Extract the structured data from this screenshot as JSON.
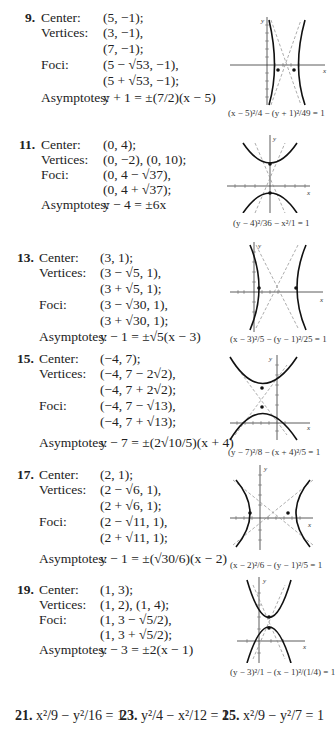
{
  "problems": [
    {
      "number": "9.",
      "labels": {
        "center": "Center:",
        "vertices": "Vertices:",
        "foci": "Foci:",
        "asymptotes": "Asymptotes:"
      },
      "center": "(5, −1);",
      "vertices": [
        "(3, −1),",
        "(7, −1);"
      ],
      "foci": [
        "(5 − √53, −1),",
        "(5 + √53, −1);"
      ],
      "asymptotes": "y + 1 = ±(7/2)(x − 5)",
      "graph_equation": "(x − 5)²/4 − (y + 1)²/49 = 1"
    },
    {
      "number": "11.",
      "labels": {
        "center": "Center:",
        "vertices": "Vertices:",
        "foci": "Foci:",
        "asymptotes": "Asymptotes:"
      },
      "center": "(0, 4);",
      "vertices": [
        "(0, −2), (0, 10);"
      ],
      "foci": [
        "(0, 4 − √37),",
        "(0, 4 + √37);"
      ],
      "asymptotes": "y − 4 = ±6x",
      "graph_equation": "(y − 4)²/36 − x²/1 = 1"
    },
    {
      "number": "13.",
      "labels": {
        "center": "Center:",
        "vertices": "Vertices:",
        "foci": "Foci:",
        "asymptotes": "Asymptotes:"
      },
      "center": "(3, 1);",
      "vertices": [
        "(3 − √5, 1),",
        "(3 + √5, 1);"
      ],
      "foci": [
        "(3 − √30, 1),",
        "(3 + √30, 1);"
      ],
      "asymptotes": "y − 1 = ±√5(x − 3)",
      "graph_equation": "(x − 3)²/5 − (y − 1)²/25 = 1"
    },
    {
      "number": "15.",
      "labels": {
        "center": "Center:",
        "vertices": "Vertices:",
        "foci": "Foci:",
        "asymptotes": "Asymptotes:"
      },
      "center": "(−4, 7);",
      "vertices": [
        "(−4, 7 − 2√2),",
        "(−4, 7 + 2√2);"
      ],
      "foci": [
        "(−4, 7 − √13),",
        "(−4, 7 + √13);"
      ],
      "asymptotes": "y − 7 = ±(2√10/5)(x + 4)",
      "graph_equation": "(y − 7)²/8 − (x + 4)²/5 = 1"
    },
    {
      "number": "17.",
      "labels": {
        "center": "Center:",
        "vertices": "Vertices:",
        "foci": "Foci:",
        "asymptotes": "Asymptotes:"
      },
      "center": "(2, 1);",
      "vertices": [
        "(2 − √6, 1),",
        "(2 + √6, 1);"
      ],
      "foci": [
        "(2 − √11, 1),",
        "(2 + √11, 1);"
      ],
      "asymptotes": "y − 1 = ±(√30/6)(x − 2)",
      "graph_equation": "(x − 2)²/6 − (y − 1)²/5 = 1"
    },
    {
      "number": "19.",
      "labels": {
        "center": "Center:",
        "vertices": "Vertices:",
        "foci": "Foci:",
        "asymptotes": "Asymptotes:"
      },
      "center": "(1, 3);",
      "vertices": [
        "(1, 2), (1, 4);"
      ],
      "foci": [
        "(1, 3 − √5/2),",
        "(1, 3 + √5/2);"
      ],
      "asymptotes": "y − 3 = ±2(x − 1)",
      "graph_equation": "(y − 3)²/1 − (x − 1)²/(1/4) = 1"
    }
  ],
  "bottom_answers": [
    {
      "number": "21.",
      "equation": "x²/9 − y²/16 = 1"
    },
    {
      "number": "23.",
      "equation": "y²/4 − x²/12 = 1"
    },
    {
      "number": "25.",
      "equation": "x²/9 − y²/7 = 1"
    }
  ],
  "axis_labels": {
    "x": "x",
    "y": "y"
  }
}
